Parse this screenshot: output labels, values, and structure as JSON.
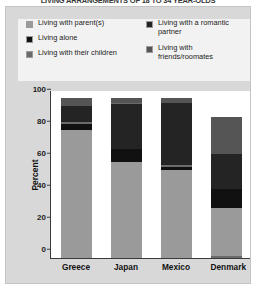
{
  "title": "LIVING ARRANGEMENTS OF 18 TO 34 YEAR-OLDS",
  "axis": {
    "ylabel": "Percent",
    "yticks": [
      "100",
      "80",
      "60",
      "40",
      "20",
      "0"
    ]
  },
  "legend": {
    "left": [
      {
        "label": "Living with parent(s)",
        "color": "#9a9a9a",
        "key": "parents"
      },
      {
        "label": "Living alone",
        "color": "#111111",
        "key": "alone"
      },
      {
        "label": "Living with their children",
        "color": "#6b6b6b",
        "key": "children"
      }
    ],
    "right": [
      {
        "label": "Living with a romantic partner",
        "color": "#242424",
        "key": "partner"
      },
      {
        "label": "Living with friends/roomates",
        "color": "#555555",
        "key": "friends"
      }
    ]
  },
  "chart_data": {
    "type": "bar",
    "stacked": true,
    "title": "LIVING ARRANGEMENTS OF 18 TO 34 YEAR-OLDS",
    "xlabel": "",
    "ylabel": "Percent",
    "ylim": [
      0,
      105
    ],
    "yticks": [
      0,
      20,
      40,
      60,
      80,
      100
    ],
    "grid": false,
    "legend_position": "top",
    "categories": [
      "Greece",
      "Japan",
      "Mexico",
      "Denmark"
    ],
    "series": [
      {
        "name": "Living with parent(s)",
        "color": "#9a9a9a",
        "values": [
          80,
          60,
          55,
          30
        ]
      },
      {
        "name": "Living alone",
        "color": "#111111",
        "values": [
          4,
          8,
          2,
          12
        ]
      },
      {
        "name": "Living with their children",
        "color": "#6b6b6b",
        "values": [
          1,
          1,
          1,
          1
        ]
      },
      {
        "name": "Living with a romantic partner",
        "color": "#242424",
        "values": [
          10,
          28,
          39,
          22
        ]
      },
      {
        "name": "Living with friends/roomates",
        "color": "#555555",
        "values": [
          5,
          3,
          3,
          23
        ]
      }
    ],
    "bars": [
      {
        "category": "Greece",
        "total": 100,
        "segments": [
          {
            "key": "friends",
            "label": "Living with friends/roomates",
            "value": 5,
            "from": 95,
            "to": 100,
            "color": "#555555"
          },
          {
            "key": "partner",
            "label": "Living with a romantic partner",
            "value": 10,
            "from": 85,
            "to": 95,
            "color": "#242424"
          },
          {
            "key": "children",
            "label": "Living with their children",
            "value": 1,
            "from": 84,
            "to": 85,
            "color": "#6b6b6b"
          },
          {
            "key": "alone",
            "label": "Living alone",
            "value": 4,
            "from": 80,
            "to": 84,
            "color": "#111111"
          },
          {
            "key": "parents",
            "label": "Living with parent(s)",
            "value": 80,
            "from": 0,
            "to": 80,
            "color": "#9a9a9a"
          }
        ]
      },
      {
        "category": "Japan",
        "total": 100,
        "segments": [
          {
            "key": "friends",
            "label": "Living with friends/roomates",
            "value": 3,
            "from": 97,
            "to": 100,
            "color": "#555555"
          },
          {
            "key": "children",
            "label": "Living with their children",
            "value": 1,
            "from": 96,
            "to": 97,
            "color": "#6b6b6b"
          },
          {
            "key": "partner",
            "label": "Living with a romantic partner",
            "value": 28,
            "from": 68,
            "to": 96,
            "color": "#242424"
          },
          {
            "key": "alone",
            "label": "Living alone",
            "value": 8,
            "from": 60,
            "to": 68,
            "color": "#111111"
          },
          {
            "key": "parents",
            "label": "Living with parent(s)",
            "value": 60,
            "from": 0,
            "to": 60,
            "color": "#9a9a9a"
          }
        ]
      },
      {
        "category": "Mexico",
        "total": 100,
        "segments": [
          {
            "key": "friends",
            "label": "Living with friends/roomates",
            "value": 3,
            "from": 97,
            "to": 100,
            "color": "#555555"
          },
          {
            "key": "partner",
            "label": "Living with a romantic partner",
            "value": 39,
            "from": 58,
            "to": 97,
            "color": "#242424"
          },
          {
            "key": "children",
            "label": "Living with their children",
            "value": 1,
            "from": 57,
            "to": 58,
            "color": "#6b6b6b"
          },
          {
            "key": "alone",
            "label": "Living alone",
            "value": 2,
            "from": 55,
            "to": 57,
            "color": "#111111"
          },
          {
            "key": "parents",
            "label": "Living with parent(s)",
            "value": 55,
            "from": 0,
            "to": 55,
            "color": "#9a9a9a"
          }
        ]
      },
      {
        "category": "Denmark",
        "total": 88,
        "segments": [
          {
            "key": "friends",
            "label": "Living with friends/roomates",
            "value": 23,
            "from": 65,
            "to": 88,
            "color": "#555555"
          },
          {
            "key": "partner",
            "label": "Living with a romantic partner",
            "value": 22,
            "from": 43,
            "to": 65,
            "color": "#242424"
          },
          {
            "key": "alone",
            "label": "Living alone",
            "value": 12,
            "from": 31,
            "to": 43,
            "color": "#111111"
          },
          {
            "key": "parents",
            "label": "Living with parent(s)",
            "value": 30,
            "from": 1,
            "to": 31,
            "color": "#9a9a9a"
          },
          {
            "key": "children",
            "label": "Living with their children",
            "value": 1,
            "from": 0,
            "to": 1,
            "color": "#6b6b6b"
          }
        ]
      }
    ]
  }
}
